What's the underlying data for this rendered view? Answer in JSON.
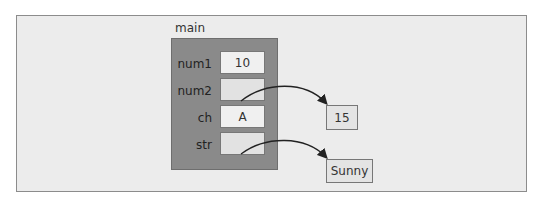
{
  "frame_label": "main",
  "variables": [
    {
      "name": "num1",
      "value": "10"
    },
    {
      "name": "num2",
      "value": ""
    },
    {
      "name": "ch",
      "value": "A"
    },
    {
      "name": "str",
      "value": ""
    }
  ],
  "heap_objects": [
    {
      "value": "15",
      "referenced_by": "num2"
    },
    {
      "value": "Sunny",
      "referenced_by": "str"
    }
  ]
}
